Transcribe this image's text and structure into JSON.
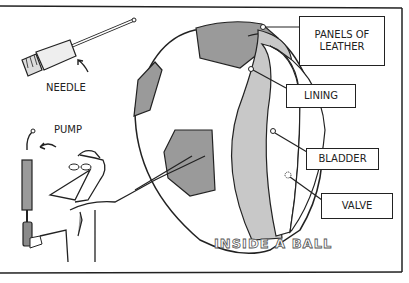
{
  "diagram": {
    "title": "INSIDE A BALL",
    "labels": {
      "needle": "NEEDLE",
      "pump": "PUMP",
      "panels": "PANELS OF LEATHER",
      "lining": "LINING",
      "bladder": "BLADDER",
      "valve": "VALVE"
    },
    "colors": {
      "panel_fill": "#9a9a9a",
      "lining_fill": "#c8c8c8",
      "line": "#222222",
      "background": "#ffffff"
    }
  }
}
